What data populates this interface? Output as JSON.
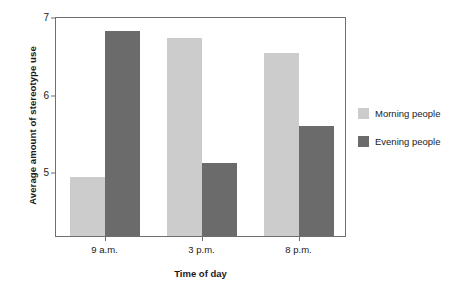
{
  "chart_data": {
    "type": "bar",
    "title": "",
    "xlabel": "Time of day",
    "ylabel": "Average amount of stereotype use",
    "categories": [
      "9 a.m.",
      "3 p.m.",
      "8 p.m."
    ],
    "series": [
      {
        "name": "Morning people",
        "color": "#cccccc",
        "values": [
          4.93,
          6.72,
          6.52
        ]
      },
      {
        "name": "Evening people",
        "color": "#6b6b6b",
        "values": [
          6.81,
          5.11,
          5.59
        ]
      }
    ],
    "ylim": [
      4.17,
      7
    ],
    "yticks": [
      5,
      6,
      7
    ],
    "ytick_labels": [
      "5",
      "6",
      "7"
    ],
    "grid": false,
    "legend_position": "right",
    "frame": true
  },
  "axes": {
    "y_title": "Average amount of stereotype use",
    "x_title": "Time of day",
    "y_ticks": [
      {
        "label": "7",
        "value": 7
      },
      {
        "label": "6",
        "value": 6
      },
      {
        "label": "5",
        "value": 5
      }
    ],
    "x_ticks": [
      {
        "label": "9 a.m."
      },
      {
        "label": "3 p.m."
      },
      {
        "label": "8 p.m."
      }
    ]
  },
  "legend": {
    "items": [
      {
        "label": "Morning people",
        "color": "#cccccc"
      },
      {
        "label": "Evening people",
        "color": "#6b6b6b"
      }
    ]
  }
}
